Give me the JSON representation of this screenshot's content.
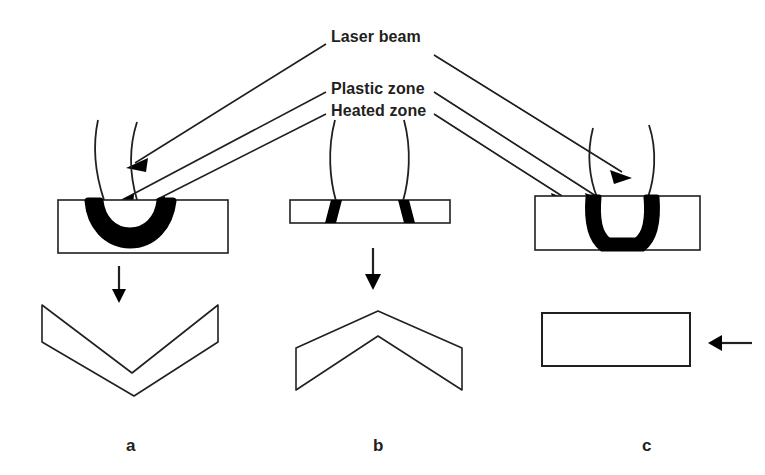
{
  "figure": {
    "background_color": "#ffffff",
    "line_color": "#231f20",
    "fill_color": "#000000",
    "width": 765,
    "height": 475
  },
  "labels": {
    "laser_beam": "Laser beam",
    "plastic_zone": "Plastic zone",
    "heated_zone": "Heated zone"
  },
  "panels": [
    {
      "letter": "a",
      "mechanism": "temperature gradient mechanism",
      "workpiece": "thick plate",
      "zone_shape": "crescent / bowl-shaped heated zone at top surface",
      "result_shape": "V-shape bent toward the laser beam",
      "bend_direction": "toward laser"
    },
    {
      "letter": "b",
      "mechanism": "buckling mechanism",
      "workpiece": "thin sheet",
      "zone_shape": "two through-thickness vertical bands",
      "result_shape": "inverted V-shape bent away from the laser beam",
      "bend_direction": "away from laser"
    },
    {
      "letter": "c",
      "mechanism": "upsetting mechanism",
      "workpiece": "thick plate",
      "zone_shape": "U-shaped through-thickness band",
      "result_shape": "flat plate, shortened and thickened",
      "bend_direction": "no bending, compression"
    }
  ],
  "arrows": {
    "panel_a_down": "downward process arrow",
    "panel_b_down": "downward process arrow",
    "panel_c_left": "leftward shortening arrow"
  }
}
